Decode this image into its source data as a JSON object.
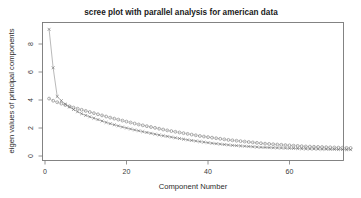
{
  "chart_data": {
    "type": "line",
    "title": "scree plot with parallel analysis for american data",
    "xlabel": "Component Number",
    "ylabel": "eigen values of principal components",
    "xlim": [
      0,
      76
    ],
    "ylim": [
      0,
      9.6
    ],
    "xticks": [
      0,
      20,
      40,
      60
    ],
    "yticks": [
      0,
      2,
      4,
      6,
      8
    ],
    "xtick_labels": [
      "0",
      "20",
      "40",
      "60"
    ],
    "ytick_labels": [
      "0",
      "2",
      "4",
      "6",
      "8"
    ],
    "grid": false,
    "legend": "none",
    "series": [
      {
        "name": "PC Actual Data",
        "marker": "x",
        "linestyle": "solid",
        "x": [
          1,
          2,
          3,
          4,
          5,
          6,
          7,
          8,
          9,
          10,
          11,
          12,
          13,
          14,
          15,
          16,
          17,
          18,
          19,
          20,
          21,
          22,
          23,
          24,
          25,
          26,
          27,
          28,
          29,
          30,
          31,
          32,
          33,
          34,
          35,
          36,
          37,
          38,
          39,
          40,
          41,
          42,
          43,
          44,
          45,
          46,
          47,
          48,
          49,
          50,
          51,
          52,
          53,
          54,
          55,
          56,
          57,
          58,
          59,
          60,
          61,
          62,
          63,
          64,
          65,
          66,
          67,
          68,
          69,
          70,
          71,
          72,
          73,
          74,
          75
        ],
        "values": [
          9.05,
          6.3,
          4.25,
          3.95,
          3.7,
          3.5,
          3.32,
          3.16,
          3.02,
          2.9,
          2.8,
          2.7,
          2.6,
          2.5,
          2.4,
          2.31,
          2.23,
          2.15,
          2.07,
          2.0,
          1.93,
          1.86,
          1.8,
          1.74,
          1.68,
          1.62,
          1.56,
          1.5,
          1.45,
          1.4,
          1.35,
          1.3,
          1.25,
          1.2,
          1.15,
          1.11,
          1.07,
          1.03,
          0.99,
          0.95,
          0.91,
          0.88,
          0.85,
          0.82,
          0.79,
          0.76,
          0.74,
          0.72,
          0.7,
          0.68,
          0.66,
          0.64,
          0.62,
          0.61,
          0.6,
          0.59,
          0.58,
          0.57,
          0.56,
          0.55,
          0.54,
          0.53,
          0.52,
          0.51,
          0.5,
          0.5,
          0.49,
          0.48,
          0.48,
          0.47,
          0.47,
          0.46,
          0.46,
          0.45,
          0.45
        ]
      },
      {
        "name": "PC Simulated Data",
        "marker": "o",
        "linestyle": "dashed",
        "x": [
          1,
          2,
          3,
          4,
          5,
          6,
          7,
          8,
          9,
          10,
          11,
          12,
          13,
          14,
          15,
          16,
          17,
          18,
          19,
          20,
          21,
          22,
          23,
          24,
          25,
          26,
          27,
          28,
          29,
          30,
          31,
          32,
          33,
          34,
          35,
          36,
          37,
          38,
          39,
          40,
          41,
          42,
          43,
          44,
          45,
          46,
          47,
          48,
          49,
          50,
          51,
          52,
          53,
          54,
          55,
          56,
          57,
          58,
          59,
          60,
          61,
          62,
          63,
          64,
          65,
          66,
          67,
          68,
          69,
          70,
          71,
          72,
          73,
          74,
          75
        ],
        "values": [
          4.1,
          3.95,
          3.84,
          3.74,
          3.64,
          3.55,
          3.46,
          3.38,
          3.3,
          3.22,
          3.14,
          3.06,
          2.98,
          2.9,
          2.82,
          2.74,
          2.67,
          2.6,
          2.53,
          2.46,
          2.39,
          2.32,
          2.25,
          2.19,
          2.13,
          2.07,
          2.01,
          1.95,
          1.89,
          1.83,
          1.78,
          1.73,
          1.68,
          1.63,
          1.58,
          1.53,
          1.48,
          1.43,
          1.39,
          1.35,
          1.31,
          1.27,
          1.23,
          1.19,
          1.15,
          1.12,
          1.09,
          1.06,
          1.03,
          1.0,
          0.97,
          0.94,
          0.91,
          0.88,
          0.86,
          0.84,
          0.82,
          0.8,
          0.78,
          0.76,
          0.74,
          0.72,
          0.7,
          0.68,
          0.67,
          0.66,
          0.65,
          0.64,
          0.63,
          0.62,
          0.61,
          0.6,
          0.59,
          0.58,
          0.57
        ]
      }
    ]
  }
}
